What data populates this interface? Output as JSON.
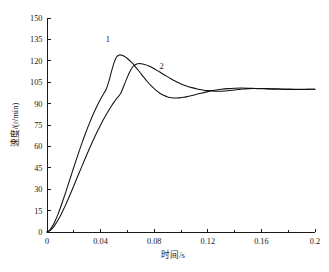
{
  "chart_data": {
    "type": "line",
    "title": "",
    "xlabel": "时间/s",
    "ylabel": "速度/(r/min)",
    "xlim": [
      0,
      0.2
    ],
    "ylim": [
      0,
      150
    ],
    "grid": false,
    "legend_position": "inline-annotation",
    "x_ticks": [
      "0",
      "0.04",
      "0.08",
      "0.12",
      "0.16",
      "0.2"
    ],
    "x_tick_values": [
      0,
      0.04,
      0.08,
      0.12,
      0.16,
      0.2
    ],
    "x_minor_tick_values": [
      0.02,
      0.06,
      0.1,
      0.14,
      0.18
    ],
    "y_ticks": [
      "0",
      "15",
      "30",
      "45",
      "60",
      "75",
      "90",
      "105",
      "120",
      "135",
      "150"
    ],
    "y_tick_values": [
      0,
      15,
      30,
      45,
      60,
      75,
      90,
      105,
      120,
      135,
      150
    ],
    "annotations": [
      {
        "label": "1",
        "x": 0.0455,
        "y": 133.5
      },
      {
        "label": "2",
        "x": 0.0855,
        "y": 114.5
      }
    ],
    "series": [
      {
        "name": "1",
        "color": "#101010",
        "x": [
          0,
          0.002,
          0.004,
          0.006,
          0.008,
          0.01,
          0.012,
          0.014,
          0.016,
          0.018,
          0.02,
          0.022,
          0.024,
          0.026,
          0.028,
          0.03,
          0.032,
          0.034,
          0.036,
          0.038,
          0.04,
          0.042,
          0.044,
          0.046,
          0.048,
          0.05,
          0.052,
          0.054,
          0.056,
          0.058,
          0.06,
          0.063,
          0.066,
          0.069,
          0.072,
          0.075,
          0.078,
          0.081,
          0.084,
          0.087,
          0.09,
          0.093,
          0.096,
          0.099,
          0.102,
          0.105,
          0.11,
          0.115,
          0.12,
          0.125,
          0.13,
          0.135,
          0.14,
          0.145,
          0.15,
          0.155,
          0.16,
          0.165,
          0.17,
          0.175,
          0.18,
          0.185,
          0.19,
          0.195,
          0.2
        ],
        "values": [
          0,
          1.4,
          4.0,
          7.6,
          12.0,
          17.0,
          22.4,
          28.0,
          33.8,
          39.6,
          45.4,
          51.1,
          56.7,
          62.1,
          67.3,
          72.3,
          77.0,
          81.5,
          85.7,
          89.6,
          93.2,
          96.6,
          99.7,
          105.0,
          112.0,
          118.6,
          122.8,
          124.1,
          123.9,
          123.0,
          121.6,
          119.0,
          115.8,
          112.3,
          108.7,
          105.3,
          102.2,
          99.6,
          97.4,
          95.8,
          94.7,
          94.1,
          93.9,
          94.0,
          94.4,
          95.0,
          96.1,
          97.3,
          98.4,
          99.3,
          100.0,
          100.5,
          100.8,
          100.9,
          100.8,
          100.6,
          100.4,
          100.2,
          100.1,
          100.0,
          99.9,
          99.9,
          99.9,
          100.0,
          100.0
        ]
      },
      {
        "name": "2",
        "color": "#101010",
        "x": [
          0,
          0.002,
          0.004,
          0.006,
          0.008,
          0.01,
          0.012,
          0.014,
          0.016,
          0.018,
          0.02,
          0.022,
          0.024,
          0.026,
          0.028,
          0.03,
          0.032,
          0.034,
          0.036,
          0.038,
          0.04,
          0.042,
          0.044,
          0.046,
          0.048,
          0.05,
          0.052,
          0.055,
          0.058,
          0.061,
          0.064,
          0.067,
          0.07,
          0.073,
          0.076,
          0.079,
          0.082,
          0.085,
          0.088,
          0.091,
          0.094,
          0.097,
          0.1,
          0.104,
          0.108,
          0.112,
          0.116,
          0.12,
          0.125,
          0.13,
          0.135,
          0.14,
          0.145,
          0.15,
          0.155,
          0.16,
          0.165,
          0.17,
          0.175,
          0.18,
          0.185,
          0.19,
          0.195,
          0.2
        ],
        "values": [
          0,
          0.9,
          2.6,
          5.0,
          8.0,
          11.4,
          15.2,
          19.2,
          23.5,
          27.9,
          32.4,
          37.0,
          41.5,
          46.0,
          50.5,
          54.9,
          59.2,
          63.4,
          67.4,
          71.3,
          75.0,
          78.6,
          82.0,
          85.2,
          88.2,
          91.0,
          93.6,
          97.2,
          104.0,
          110.8,
          115.8,
          117.8,
          118.0,
          117.4,
          116.3,
          114.9,
          113.3,
          111.6,
          109.9,
          108.2,
          106.6,
          105.1,
          103.8,
          102.4,
          101.2,
          100.3,
          99.6,
          99.1,
          98.7,
          98.7,
          99.0,
          99.6,
          100.1,
          100.5,
          100.6,
          100.6,
          100.5,
          100.4,
          100.3,
          100.2,
          100.1,
          100.1,
          100.0,
          100.0
        ]
      }
    ]
  },
  "caption": {
    "text": ""
  }
}
